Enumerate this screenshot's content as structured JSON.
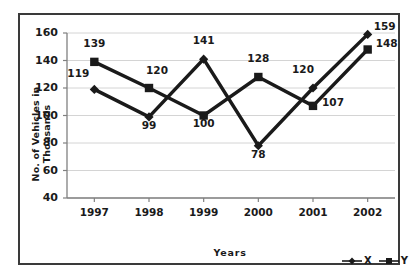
{
  "chart_data": {
    "type": "line",
    "title": "",
    "xlabel": "Years",
    "ylabel": "No. of Vehicles in Thousands",
    "categories": [
      "1997",
      "1998",
      "1999",
      "2000",
      "2001",
      "2002"
    ],
    "series": [
      {
        "name": "X",
        "marker": "diamond",
        "values": [
          119,
          99,
          141,
          78,
          120,
          159
        ]
      },
      {
        "name": "Y",
        "marker": "square",
        "values": [
          139,
          120,
          100,
          128,
          107,
          148
        ]
      }
    ],
    "yticks": [
      40,
      60,
      80,
      100,
      120,
      140,
      160
    ],
    "ylim": [
      40,
      160
    ],
    "grid": true,
    "legend_position": "bottom-right",
    "colors": {
      "series": "#1a1a1a",
      "grid": "#d4d4d4",
      "axis": "#808080",
      "border": "#3a3a3a",
      "background": "#ffffff"
    }
  },
  "labels": {
    "data_labels": {
      "X": [
        "119",
        "99",
        "141",
        "78",
        "120",
        "159"
      ],
      "Y": [
        "139",
        "120",
        "100",
        "128",
        "107",
        "148"
      ]
    }
  }
}
